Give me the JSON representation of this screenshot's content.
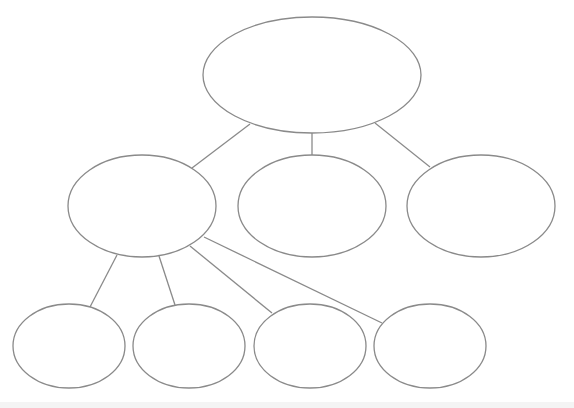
{
  "diagram": {
    "type": "hierarchy-tree",
    "stroke_color": "#8a8a8a",
    "fill_color": "#ffffff",
    "band_color": "#f4f4f4",
    "nodes": [
      {
        "id": "root",
        "label": "",
        "cx": 312,
        "cy": 75,
        "rx": 109,
        "ry": 58
      },
      {
        "id": "level1-left",
        "label": "",
        "cx": 142,
        "cy": 206,
        "rx": 74,
        "ry": 51
      },
      {
        "id": "level1-center",
        "label": "",
        "cx": 312,
        "cy": 206,
        "rx": 74,
        "ry": 51
      },
      {
        "id": "level1-right",
        "label": "",
        "cx": 481,
        "cy": 206,
        "rx": 74,
        "ry": 51
      },
      {
        "id": "level2-1",
        "label": "",
        "cx": 69,
        "cy": 346,
        "rx": 56,
        "ry": 42
      },
      {
        "id": "level2-2",
        "label": "",
        "cx": 189,
        "cy": 346,
        "rx": 56,
        "ry": 42
      },
      {
        "id": "level2-3",
        "label": "",
        "cx": 310,
        "cy": 346,
        "rx": 56,
        "ry": 42
      },
      {
        "id": "level2-4",
        "label": "",
        "cx": 430,
        "cy": 346,
        "rx": 56,
        "ry": 42
      }
    ],
    "edges": [
      {
        "from": "root",
        "to": "level1-left",
        "x1": 250,
        "y1": 124,
        "x2": 192,
        "y2": 168
      },
      {
        "from": "root",
        "to": "level1-center",
        "x1": 312,
        "y1": 133,
        "x2": 312,
        "y2": 155
      },
      {
        "from": "root",
        "to": "level1-right",
        "x1": 375,
        "y1": 123,
        "x2": 430,
        "y2": 167
      },
      {
        "from": "level1-left",
        "to": "level2-1",
        "x1": 117,
        "y1": 255,
        "x2": 90,
        "y2": 307
      },
      {
        "from": "level1-left",
        "to": "level2-2",
        "x1": 159,
        "y1": 256,
        "x2": 175,
        "y2": 305
      },
      {
        "from": "level1-left",
        "to": "level2-3",
        "x1": 190,
        "y1": 246,
        "x2": 272,
        "y2": 313
      },
      {
        "from": "level1-left",
        "to": "level2-4",
        "x1": 204,
        "y1": 237,
        "x2": 382,
        "y2": 323
      }
    ]
  }
}
